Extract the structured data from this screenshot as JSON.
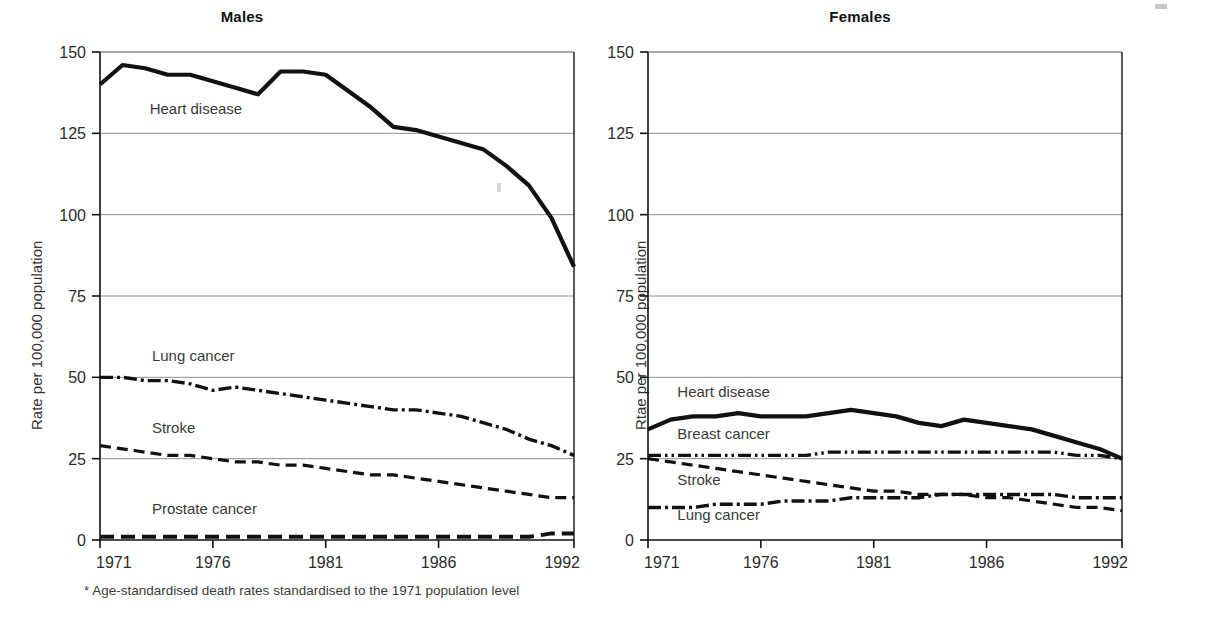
{
  "figure": {
    "footnote": "* Age-standardised death rates standardised to the 1971 population level",
    "background_color": "#ffffff",
    "line_color": "#111111",
    "grid_color": "#8d8d8d"
  },
  "panels": {
    "males": {
      "title": "Males",
      "y_axis_label": "Rate per 100,000 population",
      "y_ticks": [
        "0",
        "25",
        "50",
        "75",
        "100",
        "125",
        "150"
      ],
      "x_ticks": [
        "1971",
        "1976",
        "1981",
        "1986",
        "1992"
      ],
      "series_labels": {
        "heart_disease": "Heart disease",
        "lung_cancer": "Lung cancer",
        "stroke": "Stroke",
        "prostate_cancer": "Prostate cancer"
      }
    },
    "females": {
      "title": "Females",
      "y_axis_label": "Rtae per 100,000 population",
      "y_ticks": [
        "0",
        "25",
        "50",
        "75",
        "100",
        "125",
        "150"
      ],
      "x_ticks": [
        "1971",
        "1976",
        "1981",
        "1986",
        "1992"
      ],
      "series_labels": {
        "heart_disease": "Heart disease",
        "breast_cancer": "Breast cancer",
        "stroke": "Stroke",
        "lung_cancer": "Lung cancer"
      }
    }
  },
  "chart_data": [
    {
      "type": "line",
      "title": "Males",
      "xlabel": "",
      "ylabel": "Rate per 100,000 population",
      "xlim": [
        1971,
        1992
      ],
      "ylim": [
        0,
        150
      ],
      "yticks": [
        0,
        25,
        50,
        75,
        100,
        125,
        150
      ],
      "xticks": [
        1971,
        1976,
        1981,
        1986,
        1992
      ],
      "grid": "horizontal",
      "legend": "inline-labels",
      "x": [
        1971,
        1972,
        1973,
        1974,
        1975,
        1976,
        1977,
        1978,
        1979,
        1980,
        1981,
        1982,
        1983,
        1984,
        1985,
        1986,
        1987,
        1988,
        1989,
        1990,
        1991,
        1992
      ],
      "series": [
        {
          "name": "Heart disease",
          "style": "solid-thick",
          "values": [
            140,
            146,
            145,
            143,
            143,
            141,
            139,
            137,
            144,
            144,
            143,
            138,
            133,
            127,
            126,
            124,
            122,
            120,
            115,
            109,
            99,
            84
          ]
        },
        {
          "name": "Lung cancer",
          "style": "dash-dot",
          "values": [
            50,
            50,
            49,
            49,
            48,
            46,
            47,
            46,
            45,
            44,
            43,
            42,
            41,
            40,
            40,
            39,
            38,
            36,
            34,
            31,
            29,
            26
          ]
        },
        {
          "name": "Stroke",
          "style": "dashed",
          "values": [
            29,
            28,
            27,
            26,
            26,
            25,
            24,
            24,
            23,
            23,
            22,
            21,
            20,
            20,
            19,
            18,
            17,
            16,
            15,
            14,
            13,
            13
          ]
        },
        {
          "name": "Prostate cancer",
          "style": "long-dash-thick",
          "values": [
            1,
            1,
            1,
            1,
            1,
            1,
            1,
            1,
            1,
            1,
            1,
            1,
            1,
            1,
            1,
            1,
            1,
            1,
            1,
            1,
            2,
            2
          ]
        }
      ]
    },
    {
      "type": "line",
      "title": "Females",
      "xlabel": "",
      "ylabel": "Rtae per 100,000 population",
      "xlim": [
        1971,
        1992
      ],
      "ylim": [
        0,
        150
      ],
      "yticks": [
        0,
        25,
        50,
        75,
        100,
        125,
        150
      ],
      "xticks": [
        1971,
        1976,
        1981,
        1986,
        1992
      ],
      "grid": "horizontal",
      "legend": "inline-labels",
      "x": [
        1971,
        1972,
        1973,
        1974,
        1975,
        1976,
        1977,
        1978,
        1979,
        1980,
        1981,
        1982,
        1983,
        1984,
        1985,
        1986,
        1987,
        1988,
        1989,
        1990,
        1991,
        1992
      ],
      "series": [
        {
          "name": "Heart disease",
          "style": "solid-thick",
          "values": [
            34,
            37,
            38,
            38,
            39,
            38,
            38,
            38,
            39,
            40,
            39,
            38,
            36,
            35,
            37,
            36,
            35,
            34,
            32,
            30,
            28,
            25
          ]
        },
        {
          "name": "Breast cancer",
          "style": "dash-dot-dot",
          "values": [
            26,
            26,
            26,
            26,
            26,
            26,
            26,
            26,
            27,
            27,
            27,
            27,
            27,
            27,
            27,
            27,
            27,
            27,
            27,
            26,
            26,
            25
          ]
        },
        {
          "name": "Stroke",
          "style": "dashed",
          "values": [
            25,
            24,
            23,
            22,
            21,
            20,
            19,
            18,
            17,
            16,
            15,
            15,
            14,
            14,
            14,
            13,
            13,
            12,
            11,
            10,
            10,
            9
          ]
        },
        {
          "name": "Lung cancer",
          "style": "dash-dot",
          "values": [
            10,
            10,
            10,
            11,
            11,
            11,
            12,
            12,
            12,
            13,
            13,
            13,
            13,
            14,
            14,
            14,
            14,
            14,
            14,
            13,
            13,
            13
          ]
        }
      ]
    }
  ]
}
